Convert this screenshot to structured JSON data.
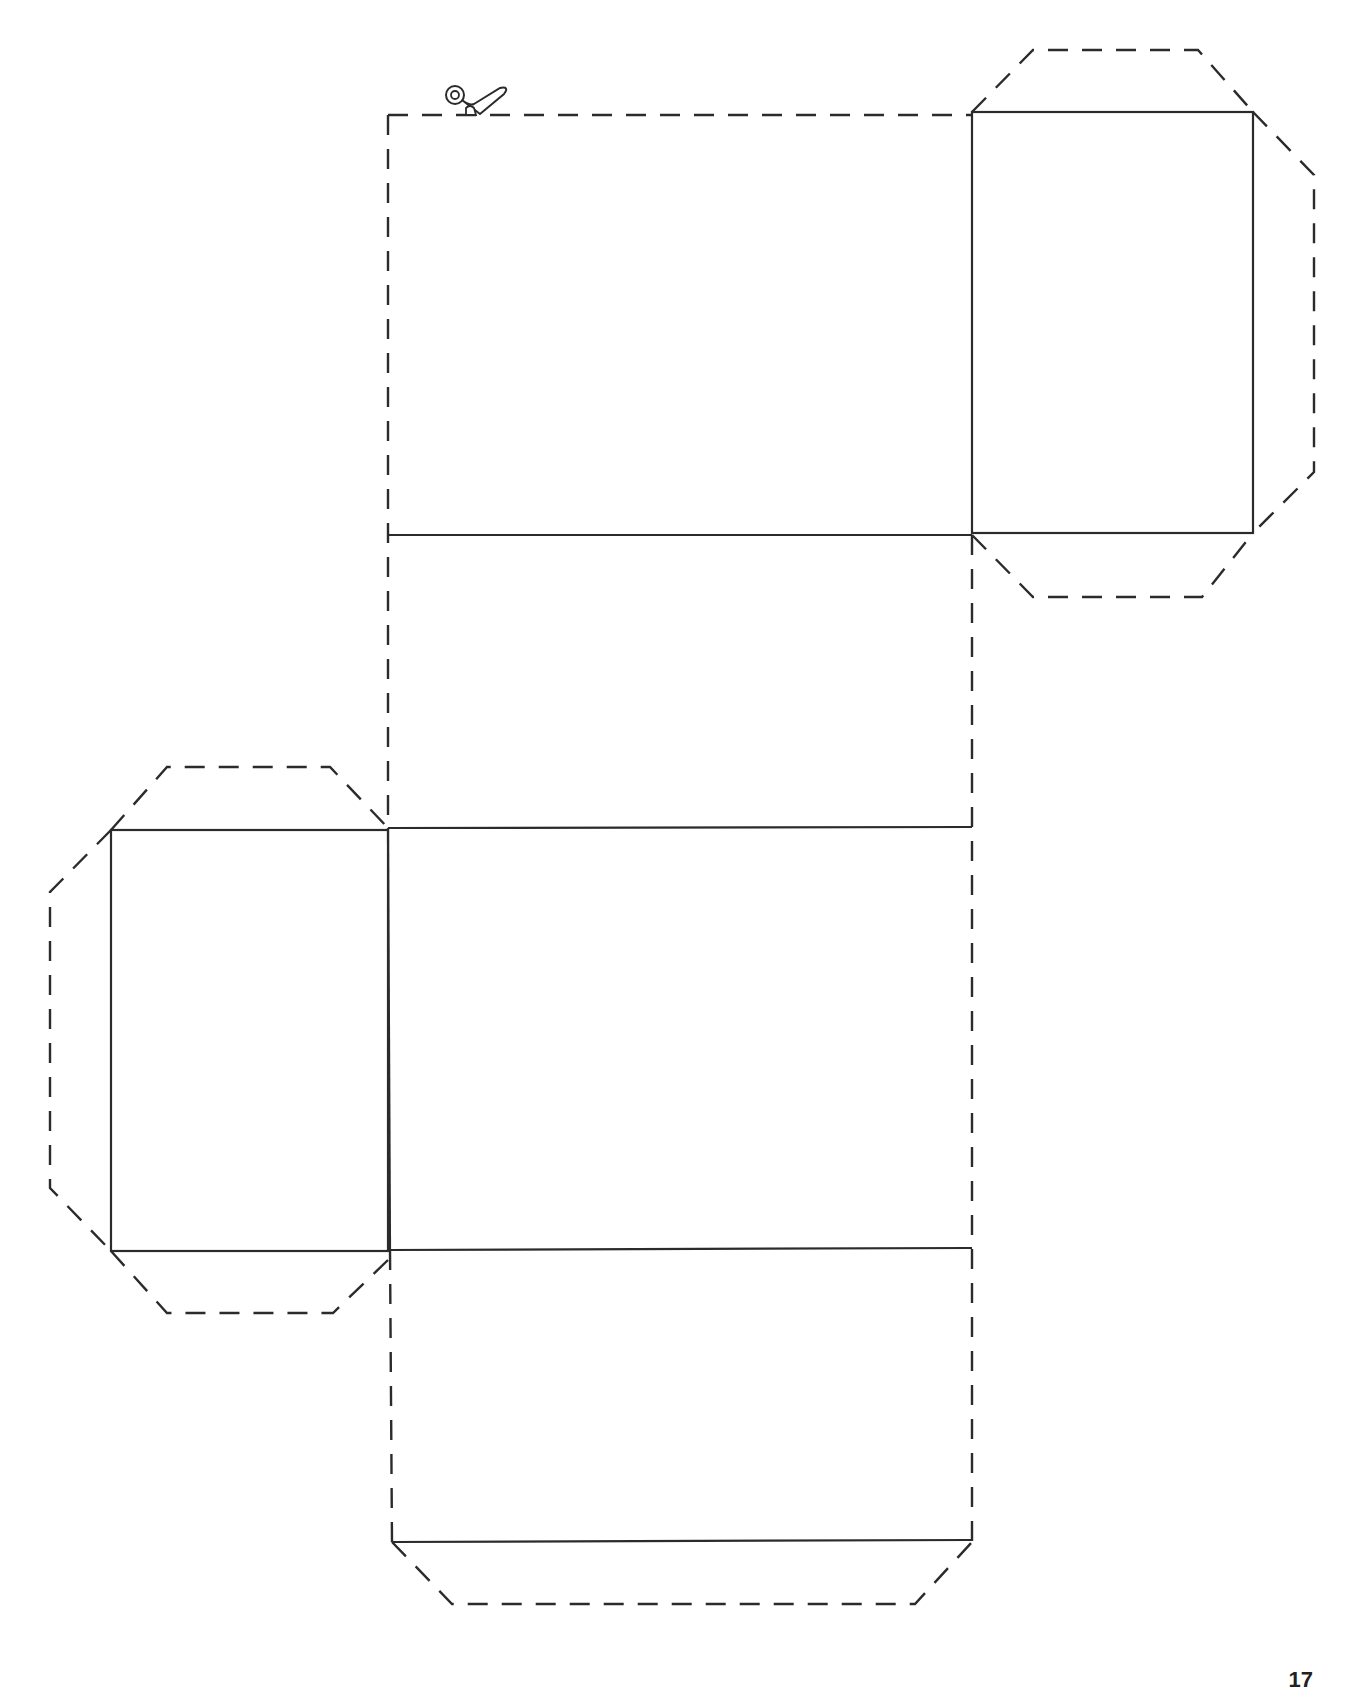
{
  "document": {
    "type": "box-net-cut-template",
    "page_number": "17"
  },
  "icons": {
    "scissors": "scissors-icon"
  },
  "colors": {
    "line": "#2b2b2b",
    "background": "#ffffff"
  },
  "legend": {
    "solid_line": "fold line",
    "dashed_line": "cut line"
  }
}
